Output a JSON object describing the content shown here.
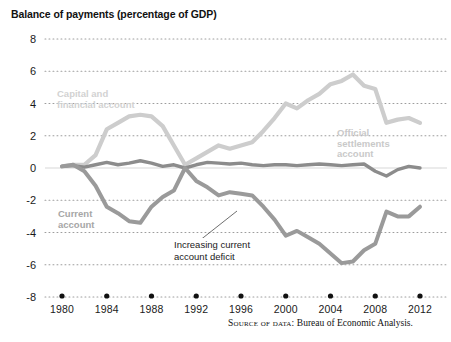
{
  "chart_data": {
    "type": "line",
    "title": "Balance of payments (percentage of GDP)",
    "xlabel": "",
    "ylabel": "",
    "xlim": [
      1980,
      2013
    ],
    "ylim": [
      -8,
      8
    ],
    "ytick_labels": [
      "8",
      "6",
      "4",
      "2",
      "0",
      "-2",
      "-4",
      "-6",
      "-8"
    ],
    "ytick_values": [
      8,
      6,
      4,
      2,
      0,
      -2,
      -4,
      -6,
      -8
    ],
    "xtick_labels": [
      "1980",
      "1984",
      "1988",
      "1992",
      "1996",
      "2000",
      "2004",
      "2008",
      "2012"
    ],
    "xtick_values": [
      1980,
      1984,
      1988,
      1992,
      1996,
      2000,
      2004,
      2008,
      2012
    ],
    "grid": true,
    "grid_style": "dotted",
    "legend_position": "inline-annotations",
    "x": [
      1980,
      1981,
      1982,
      1983,
      1984,
      1985,
      1986,
      1987,
      1988,
      1989,
      1990,
      1991,
      1992,
      1993,
      1994,
      1995,
      1996,
      1997,
      1998,
      1999,
      2000,
      2001,
      2002,
      2003,
      2004,
      2005,
      2006,
      2007,
      2008,
      2009,
      2010,
      2011,
      2012
    ],
    "series": [
      {
        "name": "Capital and financial account",
        "color": "#cdcdcd",
        "values": [
          0.1,
          0.2,
          0.2,
          0.8,
          2.4,
          2.8,
          3.2,
          3.3,
          3.2,
          2.6,
          1.4,
          0.2,
          0.6,
          1.0,
          1.4,
          1.2,
          1.4,
          1.6,
          2.3,
          3.1,
          4.0,
          3.7,
          4.2,
          4.6,
          5.2,
          5.4,
          5.8,
          5.1,
          4.9,
          2.8,
          3.0,
          3.1,
          2.8
        ]
      },
      {
        "name": "Current account",
        "color": "#9a9a9a",
        "values": [
          0.1,
          0.2,
          -0.2,
          -1.1,
          -2.4,
          -2.8,
          -3.3,
          -3.4,
          -2.4,
          -1.8,
          -1.4,
          0.0,
          -0.8,
          -1.2,
          -1.7,
          -1.5,
          -1.6,
          -1.7,
          -2.4,
          -3.2,
          -4.2,
          -3.9,
          -4.3,
          -4.7,
          -5.3,
          -5.9,
          -5.8,
          -5.1,
          -4.7,
          -2.7,
          -3.0,
          -3.0,
          -2.4
        ]
      },
      {
        "name": "Official settlements account",
        "color": "#8c8c8c",
        "values": [
          0.1,
          0.15,
          0.05,
          0.2,
          0.35,
          0.2,
          0.3,
          0.45,
          0.3,
          0.1,
          0.2,
          0.0,
          0.2,
          0.35,
          0.3,
          0.25,
          0.3,
          0.2,
          0.15,
          0.2,
          0.2,
          0.15,
          0.2,
          0.25,
          0.2,
          0.15,
          0.2,
          0.25,
          -0.2,
          -0.5,
          -0.1,
          0.1,
          0.0
        ]
      }
    ],
    "annotations": [
      {
        "name": "capital-account-label",
        "text": "Capital and\nfinancial account",
        "color": "#d2d2d2"
      },
      {
        "name": "official-settlements-label",
        "text": "Official\nsettlements\naccount",
        "color": "#c9c9c9"
      },
      {
        "name": "current-account-label",
        "text": "Current\naccount",
        "color": "#a6a6a6"
      },
      {
        "name": "increasing-deficit-callout",
        "text": "Increasing current\naccount deficit",
        "color": "#1a1a1a"
      }
    ]
  },
  "source": {
    "prefix": "Source of data:",
    "text": "Bureau of Economic Analysis."
  }
}
